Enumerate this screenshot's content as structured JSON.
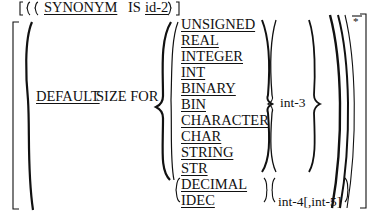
{
  "top_line": {
    "keyword": "SYNONYM",
    "is_label": "IS",
    "identifier": "id-2"
  },
  "clause": {
    "default_keyword": "DEFAULT",
    "size_for_text": "SIZE FOR"
  },
  "type_options": [
    "UNSIGNED",
    "REAL",
    "INTEGER",
    "INT",
    "BINARY",
    "BIN",
    "CHARACTER",
    "CHAR",
    "STRING",
    "STR",
    "DECIMAL",
    "IDEC"
  ],
  "size_args": {
    "int3": "int-3",
    "int4_int5": "int-4[,int-5]"
  },
  "repeat_marker": "*"
}
